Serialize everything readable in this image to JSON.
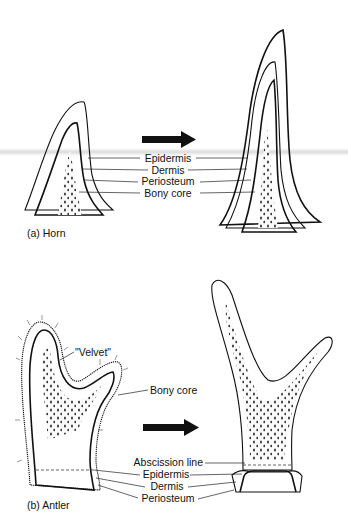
{
  "figure": {
    "panel_a": {
      "caption": "(a) Horn",
      "labels": {
        "epidermis": "Epidermis",
        "dermis": "Dermis",
        "periosteum": "Periosteum",
        "bony_core": "Bony core"
      },
      "arrow_icon": "right-arrow"
    },
    "panel_b": {
      "caption": "(b) Antler",
      "labels": {
        "velvet": "\"Velvet\"",
        "bony_core": "Bony core",
        "abscission_line": "Abscission line",
        "epidermis": "Epidermis",
        "dermis": "Dermis",
        "periosteum": "Periosteum"
      },
      "arrow_icon": "right-arrow"
    },
    "colors": {
      "ink": "#111111",
      "background": "#ffffff",
      "stipple": "#555555",
      "scan_band": "#bebebe"
    }
  }
}
